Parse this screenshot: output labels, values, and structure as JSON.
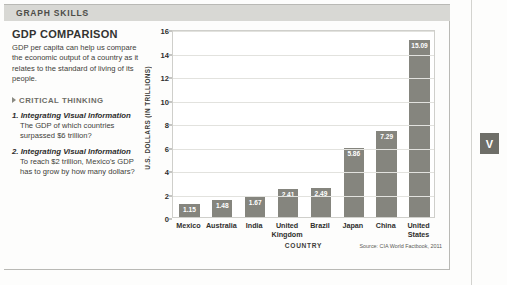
{
  "header": {
    "title": "GRAPH SKILLS",
    "chevron": "›"
  },
  "left_panel": {
    "title": "GDP COMPARISON",
    "description": "GDP per capita can help us compare the economic output of a country as it relates to the standard of living of its people.",
    "critical_thinking_label": "CRITICAL THINKING",
    "questions": [
      {
        "number": "1.",
        "title": "Integrating Visual Information",
        "body": "The GDP of which countries surpassed $6 trillion?"
      },
      {
        "number": "2.",
        "title": "Integrating Visual Information",
        "body": "To reach $2 trillion, Mexico's GDP has to grow by how many dollars?"
      }
    ]
  },
  "side_marker": {
    "label": "V"
  },
  "chart_data": {
    "type": "bar",
    "title": "GDP COMPARISON",
    "xlabel": "COUNTRY",
    "ylabel": "U.S. DOLLARS (IN TRILLIONS)",
    "categories": [
      "Mexico",
      "Australia",
      "India",
      "United Kingdom",
      "Brazil",
      "Japan",
      "China",
      "United States"
    ],
    "values": [
      1.15,
      1.48,
      1.67,
      2.41,
      2.49,
      5.86,
      7.29,
      15.09
    ],
    "value_labels": [
      "1.15",
      "1.48",
      "1.67",
      "2.41",
      "2.49",
      "5.86",
      "7.29",
      "15.09"
    ],
    "ylim": [
      0,
      16
    ],
    "yticks": [
      0,
      2,
      4,
      6,
      8,
      10,
      12,
      14,
      16
    ],
    "ytick_labels": [
      "0",
      "2",
      "4",
      "6",
      "8",
      "10",
      "12",
      "14",
      "16"
    ],
    "grid": true,
    "legend": "none",
    "bar_color": "#85857e",
    "source": "Source: CIA World Factbook, 2011"
  }
}
